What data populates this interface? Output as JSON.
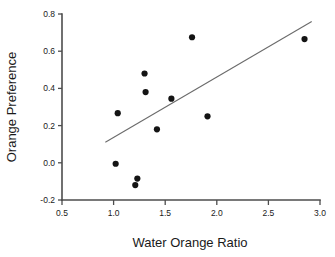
{
  "chart_data": {
    "type": "scatter",
    "title": "",
    "xlabel": "Water Orange Ratio",
    "ylabel": "Orange Preference",
    "xlim": [
      0.5,
      3.0
    ],
    "ylim": [
      -0.2,
      0.8
    ],
    "xticks": [
      0.5,
      1.0,
      1.5,
      2.0,
      2.5,
      3.0
    ],
    "yticks": [
      -0.2,
      0.0,
      0.2,
      0.4,
      0.6,
      0.8
    ],
    "xtick_labels": [
      "0.5",
      "1.0",
      "1.5",
      "2.0",
      "2.5",
      "3.0"
    ],
    "ytick_labels": [
      "-0.2",
      "0.0",
      "0.2",
      "0.4",
      "0.6",
      "0.8"
    ],
    "grid": false,
    "legend": null,
    "marker": "filled-circle",
    "marker_color": "#141414",
    "series": [
      {
        "name": "observations",
        "x": [
          1.02,
          1.04,
          1.21,
          1.23,
          1.3,
          1.31,
          1.42,
          1.56,
          1.76,
          1.91,
          2.85
        ],
        "y": [
          -0.005,
          0.267,
          -0.12,
          -0.085,
          0.48,
          0.38,
          0.18,
          0.345,
          0.675,
          0.25,
          0.665
        ]
      }
    ],
    "trendline": {
      "name": "linear-fit",
      "x_start": 0.92,
      "y_start": 0.11,
      "x_end": 2.92,
      "y_end": 0.76,
      "color": "#6b6b6b"
    },
    "axes_color": "#4d4d4d",
    "background": "#ffffff"
  },
  "labels": {
    "x_axis_title": "Water Orange Ratio",
    "y_axis_title": "Orange Preference"
  }
}
